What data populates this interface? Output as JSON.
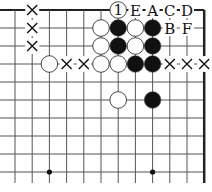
{
  "diagram": {
    "type": "go-board-fragment",
    "grid": {
      "cols": 12,
      "rows": 10,
      "x0": 15,
      "dx": 17.2,
      "y0": 10,
      "dy": 18,
      "top_edge": true,
      "right_edge": true,
      "bottom_extend": 11,
      "left_extend": 15
    },
    "colors": {
      "line": "#555555",
      "edge": "#222222",
      "black": "#111111",
      "white": "#ffffff"
    },
    "star_points": [
      [
        2,
        9
      ],
      [
        8,
        9
      ]
    ],
    "stones": [
      {
        "col": 5,
        "row": 1,
        "color": "white"
      },
      {
        "col": 5,
        "row": 2,
        "color": "white"
      },
      {
        "col": 5,
        "row": 3,
        "color": "white"
      },
      {
        "col": 6,
        "row": 1,
        "color": "black"
      },
      {
        "col": 6,
        "row": 2,
        "color": "black"
      },
      {
        "col": 6,
        "row": 3,
        "color": "white"
      },
      {
        "col": 7,
        "row": 1,
        "color": "white"
      },
      {
        "col": 7,
        "row": 2,
        "color": "white"
      },
      {
        "col": 7,
        "row": 3,
        "color": "black"
      },
      {
        "col": 8,
        "row": 1,
        "color": "black"
      },
      {
        "col": 8,
        "row": 2,
        "color": "black"
      },
      {
        "col": 8,
        "row": 3,
        "color": "black"
      },
      {
        "col": 2,
        "row": 3,
        "color": "white"
      },
      {
        "col": 6,
        "row": 5,
        "color": "white"
      },
      {
        "col": 8,
        "row": 5,
        "color": "black"
      },
      {
        "col": 6,
        "row": 0,
        "color": "white",
        "label": "1"
      }
    ],
    "markers": [
      {
        "col": 1,
        "row": 0,
        "mark": "×"
      },
      {
        "col": 1,
        "row": 1,
        "mark": "×"
      },
      {
        "col": 1,
        "row": 2,
        "mark": "×"
      },
      {
        "col": 3,
        "row": 3,
        "mark": "×"
      },
      {
        "col": 4,
        "row": 3,
        "mark": "×"
      },
      {
        "col": 9,
        "row": 3,
        "mark": "×"
      },
      {
        "col": 10,
        "row": 3,
        "mark": "×"
      },
      {
        "col": 11,
        "row": 3,
        "mark": "×"
      }
    ],
    "letters": [
      {
        "col": 7,
        "row": 0,
        "text": "E"
      },
      {
        "col": 8,
        "row": 0,
        "text": "A"
      },
      {
        "col": 9,
        "row": 0,
        "text": "C"
      },
      {
        "col": 10,
        "row": 0,
        "text": "D"
      },
      {
        "col": 9,
        "row": 1,
        "text": "B"
      },
      {
        "col": 10,
        "row": 1,
        "text": "F"
      }
    ]
  }
}
